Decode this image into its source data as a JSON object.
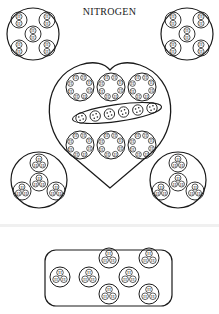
{
  "title": "NITROGEN",
  "colors": {
    "ink": "#1a1a1a",
    "background": "#ffffff"
  },
  "atom_label": "H",
  "groups": {
    "top_left_circle": {
      "label": "top-left-molecule-group",
      "subgroups": 5,
      "atoms_per_subgroup": 2
    },
    "top_right_circle": {
      "label": "top-right-molecule-group",
      "subgroups": 5,
      "atoms_per_subgroup": 2
    },
    "heart": {
      "label": "central-heart-group",
      "top_row_rings": 3,
      "middle_ellipse_atoms": 6,
      "bottom_row_rings": 3
    },
    "bottom_left_circle": {
      "label": "bottom-left-molecule-group",
      "subgroups": 4,
      "atoms_per_subgroup": 3
    },
    "bottom_right_circle": {
      "label": "bottom-right-molecule-group",
      "subgroups": 4,
      "atoms_per_subgroup": 3
    },
    "bottom_box": {
      "label": "bottom-box-group",
      "clusters": 7,
      "atoms_per_cluster": 3
    }
  }
}
